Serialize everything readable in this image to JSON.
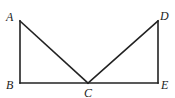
{
  "diagram": {
    "type": "geometry",
    "points": [
      {
        "id": "A",
        "label": "A",
        "x": 20,
        "y": 21,
        "lx": 6,
        "ly": 21
      },
      {
        "id": "B",
        "label": "B",
        "x": 20,
        "y": 83,
        "lx": 6,
        "ly": 89
      },
      {
        "id": "C",
        "label": "C",
        "x": 88,
        "y": 83,
        "lx": 84,
        "ly": 97
      },
      {
        "id": "D",
        "label": "D",
        "x": 158,
        "y": 21,
        "lx": 160,
        "ly": 20
      },
      {
        "id": "E",
        "label": "E",
        "x": 158,
        "y": 83,
        "lx": 161,
        "ly": 89
      }
    ],
    "segments": [
      [
        "A",
        "B"
      ],
      [
        "B",
        "E"
      ],
      [
        "A",
        "C"
      ],
      [
        "C",
        "D"
      ],
      [
        "D",
        "E"
      ]
    ],
    "stroke_color": "#222222"
  }
}
